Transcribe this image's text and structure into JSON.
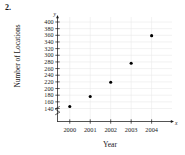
{
  "problem": {
    "number": "2."
  },
  "chart_data": {
    "type": "scatter",
    "title": "",
    "xlabel": "Year",
    "ylabel": "Number of Locations",
    "x": [
      2000,
      2001,
      2002,
      2003,
      2004
    ],
    "values": [
      146,
      176,
      219,
      276,
      359
    ],
    "categories": [
      "2000",
      "2001",
      "2002",
      "2003",
      "2004"
    ],
    "xtick_labels": [
      "2000",
      "2001",
      "2002",
      "2003",
      "2004"
    ],
    "ytick_labels": [
      "140",
      "160",
      "180",
      "200",
      "220",
      "240",
      "260",
      "280",
      "300",
      "320",
      "340",
      "360",
      "380",
      "400"
    ],
    "ytick_values": [
      140,
      160,
      180,
      200,
      220,
      240,
      260,
      280,
      300,
      320,
      340,
      360,
      380,
      400
    ],
    "ylim": [
      130,
      410
    ],
    "xlim": [
      1999.4,
      2004.8
    ],
    "grid": true,
    "legend": false,
    "legend_position": "none",
    "axis_break": true,
    "x_axis_letter": "x",
    "y_axis_letter": "y",
    "point_color": "#000000",
    "grid_color": "#e8e8e8",
    "axis_color": "#1a1a1a"
  }
}
